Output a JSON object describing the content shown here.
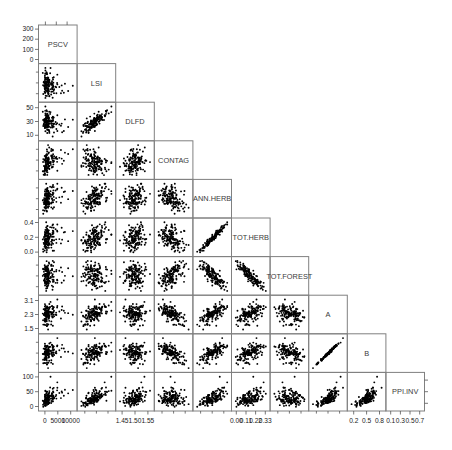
{
  "figure": {
    "type": "scatterplot-matrix",
    "title": "",
    "n_vars": 10,
    "layout": "lower-triangular",
    "point_color": "#000000",
    "panel_border_color": "#808080",
    "background": "#ffffff"
  },
  "variables": [
    {
      "index": 0,
      "name": "PSCV",
      "tick_labels": [
        "0",
        "5000",
        "10000"
      ],
      "tick_values": [
        0,
        5000,
        10000
      ],
      "range": [
        -1500,
        12500
      ]
    },
    {
      "index": 1,
      "name": "LSI",
      "tick_labels": [],
      "tick_values": [],
      "range": [
        0,
        1
      ]
    },
    {
      "index": 2,
      "name": "DLFD",
      "tick_labels": [
        "1.45",
        "1.50",
        "1.55"
      ],
      "tick_values": [
        1.45,
        1.5,
        1.55
      ],
      "range": [
        1.42,
        1.58
      ]
    },
    {
      "index": 3,
      "name": "CONTAG",
      "tick_labels": [],
      "tick_values": [],
      "range": [
        0,
        1
      ]
    },
    {
      "index": 4,
      "name": "ANN.HERB",
      "tick_labels": [],
      "tick_values": [],
      "range": [
        0,
        1
      ]
    },
    {
      "index": 5,
      "name": "TOT.HERB",
      "tick_labels": [
        "0.00",
        "0.11",
        "0.22",
        "0.33"
      ],
      "tick_values": [
        0.0,
        0.11,
        0.22,
        0.33
      ],
      "range": [
        -0.05,
        0.42
      ]
    },
    {
      "index": 6,
      "name": "TOT.FOREST",
      "tick_labels": [],
      "tick_values": [],
      "range": [
        0,
        1
      ]
    },
    {
      "index": 7,
      "name": "A",
      "tick_labels": [],
      "tick_values": [],
      "range": [
        0,
        1
      ]
    },
    {
      "index": 8,
      "name": "B",
      "tick_labels": [
        "0.2",
        "0.5",
        "0.8"
      ],
      "tick_values": [
        0.2,
        0.5,
        0.8
      ],
      "range": [
        0.05,
        0.95
      ]
    },
    {
      "index": 9,
      "name": "PPI.INV",
      "tick_labels": [
        "0.1",
        "0.3",
        "0.5",
        "0.7"
      ],
      "tick_values": [
        0.1,
        0.3,
        0.5,
        0.7
      ],
      "range": [
        0.0,
        0.8
      ]
    }
  ],
  "left_axis_labels": [
    {
      "row": 0,
      "variable": "PSCV",
      "labels": [
        "300",
        "200",
        "100",
        "0"
      ],
      "values": [
        300,
        200,
        100,
        0
      ],
      "range": [
        -40,
        340
      ]
    },
    {
      "row": 2,
      "variable": "DLFD",
      "labels": [
        "50",
        "30",
        "10"
      ],
      "values": [
        50,
        30,
        10
      ],
      "range": [
        2,
        58
      ]
    },
    {
      "row": 5,
      "variable": "TOT.HERB",
      "labels": [
        "0.4",
        "0.2",
        "0.0"
      ],
      "values": [
        0.4,
        0.2,
        0.0
      ],
      "range": [
        -0.06,
        0.46
      ]
    },
    {
      "row": 7,
      "variable": "A",
      "labels": [
        "3.1",
        "2.3",
        "1.5"
      ],
      "values": [
        3.1,
        2.3,
        1.5
      ],
      "range": [
        1.2,
        3.4
      ]
    },
    {
      "row": 9,
      "variable": "PPI.INV",
      "labels": [
        "100",
        "50",
        "0"
      ],
      "values": [
        100,
        50,
        0
      ],
      "range": [
        -15,
        115
      ]
    }
  ],
  "bottom_axis_labels": [
    {
      "col": 0,
      "variable": "PSCV",
      "labels": [
        "0",
        "5000",
        "10000"
      ]
    },
    {
      "col": 2,
      "variable": "DLFD",
      "labels": [
        "1.45",
        "1.50",
        "1.55"
      ]
    },
    {
      "col": 5,
      "variable": "TOT.HERB",
      "labels": [
        "0.00",
        "0.11",
        "0.22",
        "0.33"
      ]
    },
    {
      "col": 8,
      "variable": "B",
      "labels": [
        "0.2",
        "0.5",
        "0.8"
      ]
    },
    {
      "col": 9,
      "variable": "PPI.INV",
      "labels": [
        "0.1",
        "0.3",
        "0.5",
        "0.7"
      ]
    }
  ],
  "chart_data": {
    "type": "scatter",
    "title": "",
    "xlabel": "",
    "ylabel": "",
    "matrix": "lower-triangular scatterplot matrix of 10 landscape metrics",
    "categories": [
      "PSCV",
      "LSI",
      "DLFD",
      "CONTAG",
      "ANN.HERB",
      "TOT.HERB",
      "TOT.FOREST",
      "A",
      "B",
      "PPI.INV"
    ],
    "n_points": 150,
    "correlations": [
      {
        "x": "PSCV",
        "y": "LSI",
        "r": -0.35,
        "note": "negative, wedge-shaped cloud"
      },
      {
        "x": "PSCV",
        "y": "DLFD",
        "r": -0.3
      },
      {
        "x": "PSCV",
        "y": "CONTAG",
        "r": -0.2
      },
      {
        "x": "PSCV",
        "y": "ANN.HERB",
        "r": 0.05
      },
      {
        "x": "PSCV",
        "y": "TOT.HERB",
        "r": 0.1
      },
      {
        "x": "PSCV",
        "y": "TOT.FOREST",
        "r": -0.1
      },
      {
        "x": "PSCV",
        "y": "A",
        "r": -0.15
      },
      {
        "x": "PSCV",
        "y": "B",
        "r": -0.2
      },
      {
        "x": "PSCV",
        "y": "PPI.INV",
        "r": -0.15
      },
      {
        "x": "LSI",
        "y": "DLFD",
        "r": 0.25
      },
      {
        "x": "LSI",
        "y": "CONTAG",
        "r": -0.25
      },
      {
        "x": "LSI",
        "y": "ANN.HERB",
        "r": 0.1
      },
      {
        "x": "LSI",
        "y": "TOT.HERB",
        "r": 0.15
      },
      {
        "x": "LSI",
        "y": "TOT.FOREST",
        "r": -0.15
      },
      {
        "x": "LSI",
        "y": "A",
        "r": 0.2
      },
      {
        "x": "LSI",
        "y": "B",
        "r": 0.1
      },
      {
        "x": "LSI",
        "y": "PPI.INV",
        "r": 0.05
      },
      {
        "x": "DLFD",
        "y": "CONTAG",
        "r": -0.4
      },
      {
        "x": "DLFD",
        "y": "ANN.HERB",
        "r": 0.05
      },
      {
        "x": "DLFD",
        "y": "TOT.HERB",
        "r": 0.1
      },
      {
        "x": "DLFD",
        "y": "TOT.FOREST",
        "r": -0.1
      },
      {
        "x": "DLFD",
        "y": "A",
        "r": 0.15
      },
      {
        "x": "DLFD",
        "y": "B",
        "r": 0.05
      },
      {
        "x": "DLFD",
        "y": "PPI.INV",
        "r": 0.05
      },
      {
        "x": "CONTAG",
        "y": "ANN.HERB",
        "r": -0.45,
        "note": "curved negative"
      },
      {
        "x": "CONTAG",
        "y": "TOT.HERB",
        "r": -0.35
      },
      {
        "x": "CONTAG",
        "y": "TOT.FOREST",
        "r": 0.35
      },
      {
        "x": "CONTAG",
        "y": "A",
        "r": -0.2
      },
      {
        "x": "CONTAG",
        "y": "B",
        "r": -0.25
      },
      {
        "x": "CONTAG",
        "y": "PPI.INV",
        "r": -0.1
      },
      {
        "x": "ANN.HERB",
        "y": "TOT.HERB",
        "r": 0.75,
        "note": "strong positive"
      },
      {
        "x": "ANN.HERB",
        "y": "TOT.FOREST",
        "r": -0.6
      },
      {
        "x": "ANN.HERB",
        "y": "A",
        "r": 0.25
      },
      {
        "x": "ANN.HERB",
        "y": "B",
        "r": 0.3
      },
      {
        "x": "ANN.HERB",
        "y": "PPI.INV",
        "r": 0.15
      },
      {
        "x": "TOT.HERB",
        "y": "TOT.FOREST",
        "r": -0.95,
        "note": "very strong negative, near-linear band"
      },
      {
        "x": "TOT.HERB",
        "y": "A",
        "r": 0.3
      },
      {
        "x": "TOT.HERB",
        "y": "B",
        "r": 0.35
      },
      {
        "x": "TOT.HERB",
        "y": "PPI.INV",
        "r": 0.2
      },
      {
        "x": "TOT.FOREST",
        "y": "A",
        "r": -0.3
      },
      {
        "x": "TOT.FOREST",
        "y": "B",
        "r": -0.35
      },
      {
        "x": "TOT.FOREST",
        "y": "PPI.INV",
        "r": -0.2
      },
      {
        "x": "A",
        "y": "B",
        "r": 0.7,
        "note": "strong positive"
      },
      {
        "x": "A",
        "y": "PPI.INV",
        "r": 0.2
      },
      {
        "x": "B",
        "y": "PPI.INV",
        "r": 0.25
      }
    ]
  }
}
